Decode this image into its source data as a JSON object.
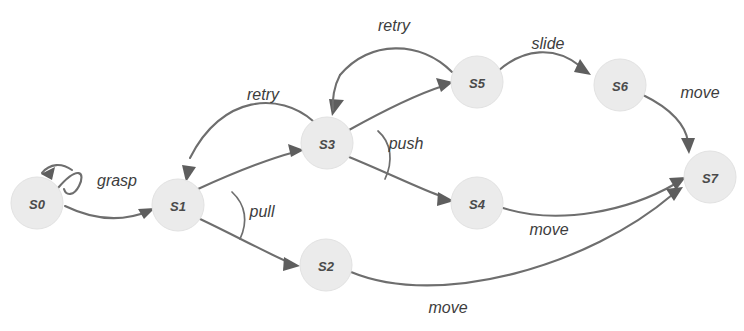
{
  "diagram": {
    "kind": "state-transition-diagram",
    "width": 744,
    "height": 331,
    "background_color": "#ffffff",
    "node_fill_color": "#ebebeb",
    "node_text_color": "#4a4a4a",
    "edge_color": "#6e6e6e",
    "label_text_color": "#3d3d3d",
    "nodes": [
      {
        "id": "S0",
        "label": "S0",
        "cx": 37,
        "cy": 203,
        "r": 26
      },
      {
        "id": "S1",
        "label": "S1",
        "cx": 178,
        "cy": 205,
        "r": 26
      },
      {
        "id": "S2",
        "label": "S2",
        "cx": 326,
        "cy": 265,
        "r": 26
      },
      {
        "id": "S3",
        "label": "S3",
        "cx": 327,
        "cy": 143,
        "r": 26
      },
      {
        "id": "S4",
        "label": "S4",
        "cx": 477,
        "cy": 203,
        "r": 26
      },
      {
        "id": "S5",
        "label": "S5",
        "cx": 477,
        "cy": 82,
        "r": 26
      },
      {
        "id": "S6",
        "label": "S6",
        "cx": 620,
        "cy": 85,
        "r": 26
      },
      {
        "id": "S7",
        "label": "S7",
        "cx": 710,
        "cy": 177,
        "r": 26
      }
    ],
    "edges": [
      {
        "id": "e-s0-self",
        "from": "S0",
        "to": "S0",
        "label": "grasp",
        "label_x": 117,
        "label_y": 180,
        "kind": "self-loop"
      },
      {
        "id": "e-s0-s1",
        "from": "S0",
        "to": "S1",
        "label": "",
        "label_x": 0,
        "label_y": 0,
        "kind": "curve"
      },
      {
        "id": "e-s3-s1",
        "from": "S3",
        "to": "S1",
        "label": "retry",
        "label_x": 263,
        "label_y": 94,
        "kind": "curve"
      },
      {
        "id": "e-s1-s3",
        "from": "S1",
        "to": "S3",
        "label": "pull",
        "label_x": 262,
        "label_y": 211,
        "kind": "curve"
      },
      {
        "id": "e-s1-s2",
        "from": "S1",
        "to": "S2",
        "label": "",
        "label_x": 0,
        "label_y": 0,
        "kind": "curve"
      },
      {
        "id": "e-s5-s3",
        "from": "S5",
        "to": "S3",
        "label": "retry",
        "label_x": 394,
        "label_y": 25,
        "kind": "curve"
      },
      {
        "id": "e-s3-s5",
        "from": "S3",
        "to": "S5",
        "label": "push",
        "label_x": 406,
        "label_y": 143,
        "kind": "curve"
      },
      {
        "id": "e-s3-s4",
        "from": "S3",
        "to": "S4",
        "label": "",
        "label_x": 0,
        "label_y": 0,
        "kind": "curve"
      },
      {
        "id": "e-s5-s6",
        "from": "S5",
        "to": "S6",
        "label": "slide",
        "label_x": 548,
        "label_y": 43,
        "kind": "curve"
      },
      {
        "id": "e-s6-s7",
        "from": "S6",
        "to": "S7",
        "label": "move",
        "label_x": 700,
        "label_y": 92,
        "kind": "curve"
      },
      {
        "id": "e-s4-s7",
        "from": "S4",
        "to": "S7",
        "label": "move",
        "label_x": 549,
        "label_y": 229,
        "kind": "curve"
      },
      {
        "id": "e-s2-s7",
        "from": "S2",
        "to": "S7",
        "label": "move",
        "label_x": 448,
        "label_y": 307,
        "kind": "curve"
      }
    ],
    "branch_braces": [
      {
        "id": "brace-pull",
        "at_node": "S1",
        "label": "pull"
      },
      {
        "id": "brace-push",
        "at_node": "S3",
        "label": "push"
      }
    ]
  }
}
